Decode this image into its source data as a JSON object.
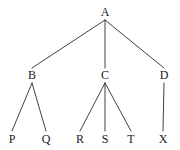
{
  "diagram": {
    "type": "tree-graph",
    "title": "",
    "background_color": "#ffffff",
    "edge_color": "#2b2b2b",
    "label_color": "#1a1a1a",
    "nodes": [
      {
        "id": "A",
        "label": "A",
        "x": 105,
        "y": 12,
        "level": 0
      },
      {
        "id": "B",
        "label": "B",
        "x": 32,
        "y": 75,
        "level": 1
      },
      {
        "id": "C",
        "label": "C",
        "x": 105,
        "y": 75,
        "level": 1
      },
      {
        "id": "D",
        "label": "D",
        "x": 164,
        "y": 75,
        "level": 1
      },
      {
        "id": "P",
        "label": "P",
        "x": 12,
        "y": 139,
        "level": 2
      },
      {
        "id": "Q",
        "label": "Q",
        "x": 46,
        "y": 139,
        "level": 2
      },
      {
        "id": "R",
        "label": "R",
        "x": 80,
        "y": 139,
        "level": 2
      },
      {
        "id": "S",
        "label": "S",
        "x": 105,
        "y": 139,
        "level": 2
      },
      {
        "id": "T",
        "label": "T",
        "x": 131,
        "y": 139,
        "level": 2
      },
      {
        "id": "X",
        "label": "X",
        "x": 163,
        "y": 139,
        "level": 2
      }
    ],
    "edges": [
      {
        "from": "A",
        "to": "B",
        "x1": 105,
        "y1": 20,
        "x2": 32,
        "y2": 68
      },
      {
        "from": "A",
        "to": "C",
        "x1": 105,
        "y1": 20,
        "x2": 105,
        "y2": 68
      },
      {
        "from": "A",
        "to": "D",
        "x1": 105,
        "y1": 20,
        "x2": 164,
        "y2": 68
      },
      {
        "from": "B",
        "to": "P",
        "x1": 32,
        "y1": 83,
        "x2": 12,
        "y2": 131
      },
      {
        "from": "B",
        "to": "Q",
        "x1": 32,
        "y1": 83,
        "x2": 46,
        "y2": 131
      },
      {
        "from": "C",
        "to": "R",
        "x1": 105,
        "y1": 83,
        "x2": 80,
        "y2": 131
      },
      {
        "from": "C",
        "to": "S",
        "x1": 105,
        "y1": 83,
        "x2": 105,
        "y2": 131
      },
      {
        "from": "C",
        "to": "T",
        "x1": 105,
        "y1": 83,
        "x2": 131,
        "y2": 131
      },
      {
        "from": "D",
        "to": "X",
        "x1": 164,
        "y1": 83,
        "x2": 163,
        "y2": 131
      }
    ]
  }
}
